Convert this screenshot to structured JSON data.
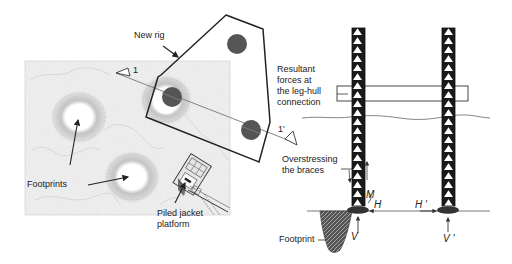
{
  "colors": {
    "stroke": "#222222",
    "map_bg": "#f1f1f1",
    "contour": "#b8b8b8",
    "leg_circle": "#555555",
    "section_line": "#777777",
    "truss_fill": "#1a1a1a",
    "text": "#222222"
  },
  "left_panel": {
    "labels": {
      "new_rig": "New rig",
      "footprints": "Footprints",
      "piled_jacket_line1": "Piled jacket",
      "piled_jacket_line2": "platform",
      "section_start": "1",
      "section_end": "1'"
    }
  },
  "right_panel": {
    "labels": {
      "resultant_line1": "Resultant",
      "resultant_line2": "forces at",
      "resultant_line3": "the leg-hull",
      "resultant_line4": "connection",
      "overstress_line1": "Overstressing",
      "overstress_line2": "the braces",
      "footprint": "Footprint",
      "moment": "M",
      "horizontal": "H",
      "horizontal_prime": "H '",
      "vertical": "V",
      "vertical_prime": "V '"
    }
  }
}
